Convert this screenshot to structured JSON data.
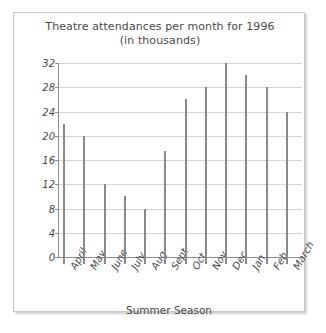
{
  "chart_data": {
    "type": "bar",
    "title": "Theatre attendances per month for 1996",
    "subtitle": "(in thousands)",
    "xlabel": "Summer Season",
    "ylabel": "",
    "categories": [
      "April",
      "May",
      "June",
      "July",
      "Aug",
      "Sept",
      "Oct",
      "Nov",
      "Dec",
      "Jan",
      "Feb",
      "March"
    ],
    "values": [
      22,
      20,
      12,
      10,
      8,
      17.5,
      26,
      28,
      32,
      30,
      28,
      24
    ],
    "yticks": [
      0,
      4,
      8,
      12,
      16,
      20,
      24,
      28,
      32
    ],
    "ytick_labels": [
      "0",
      "4",
      "8",
      "12",
      "16",
      "20",
      "24",
      "28",
      "32"
    ],
    "ylim": [
      0,
      32
    ],
    "grid": true,
    "legend": false,
    "bar_style": "thin-line",
    "colors": {
      "bar": "#8a8a8a",
      "grid": "#d2d2d2",
      "axis": "#8d8d8d",
      "text": "#4a4a4a",
      "background": "#ffffff",
      "frame_border": "#c9c9c9"
    }
  }
}
